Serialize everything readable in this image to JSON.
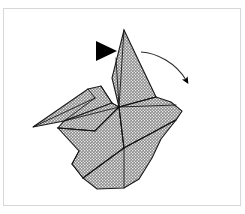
{
  "figure": {
    "caption": "Paper crane form with fold direction arrow",
    "background_color": "#ffffff",
    "border_color": "#d8d8d8",
    "paper_fill_color": "#8a8a8a",
    "paper_pattern": "fine-dot-stipple",
    "fold_line_color": "#111111",
    "outline_color": "#1a1a1a",
    "marker_color": "#000000"
  },
  "annotations": {
    "pointer_triangle": {
      "name": "solid-triangle-pointer",
      "label": "Fold indicator triangle",
      "direction": "right",
      "x": 96,
      "y": 41,
      "width": 21,
      "height": 20
    },
    "motion_arrow": {
      "name": "curved-fold-arrow",
      "label": "Fold this flap down and to the right",
      "start_x": 141,
      "start_y": 52,
      "end_x": 189,
      "end_y": 87,
      "arrowhead_direction": "down-right"
    }
  },
  "model": {
    "name": "paper-crane",
    "parts": [
      {
        "name": "neck-head",
        "label": "Raised neck and head flap"
      },
      {
        "name": "left-wing",
        "label": "Left wing flap"
      },
      {
        "name": "body-front",
        "label": "Front body panel"
      },
      {
        "name": "body-right",
        "label": "Right body panel"
      },
      {
        "name": "tail-lower",
        "label": "Lower tail panel"
      }
    ]
  },
  "geometry": {
    "outline": "M124,30 L156,97 L171,102 L176,105 L182,111 L176,120 L161,139 L152,158 L139,179 L124,188 L97,189 L83,178 L72,164 L79,151 L88,141 L76,139 L63,133 L58,128 L64,121 L48,124 L33,127 L42,119 L60,106 L75,96 L88,89 L101,86 L109,88 L112,78 L116,58 Z",
    "neck_flap": "M124,30 L156,97 L119,107 L112,78 Z",
    "neck_flap_inner": "M124,30 L119,107 L112,78 L116,58 Z",
    "left_wing": "M33,127 L88,89 L101,86 L112,103 L64,121 Z",
    "left_wing_inner": "M33,127 L88,89 L95,98 L64,121 Z",
    "wing_under": "M64,121 L112,103 L119,107 L95,131 L58,128 Z",
    "body_front": "M58,128 L95,131 L119,107 L124,148 L83,178 L72,164 Z",
    "body_right": "M119,107 L176,105 L182,111 L176,120 L124,148 Z",
    "body_lower": "M124,148 L176,120 L161,139 L152,158 L139,179 L124,188 L97,189 L83,178 Z",
    "fold_lines": [
      "M124,30 L119,107",
      "M116,58 L119,107",
      "M156,97 L119,107",
      "M88,89 L95,98",
      "M33,127 L95,98",
      "M101,86 L112,103",
      "M112,103 L119,107",
      "M64,121 L119,107",
      "M58,128 L95,131",
      "M95,131 L119,107",
      "M119,107 L124,148",
      "M119,107 L176,105",
      "M124,148 L176,120",
      "M124,148 L83,178",
      "M83,178 L72,164",
      "M72,164 L79,151",
      "M124,148 L124,188"
    ]
  }
}
